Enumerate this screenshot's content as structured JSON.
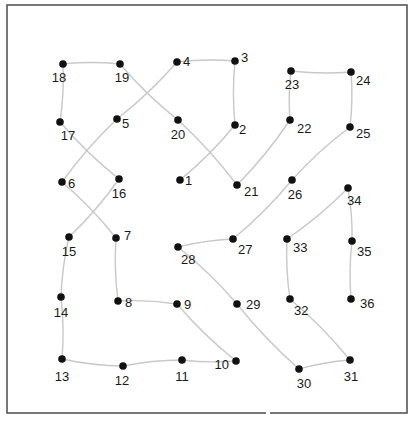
{
  "puzzle": {
    "type": "connect-the-dots",
    "frame": {
      "x": 7,
      "y": 5,
      "width": 400,
      "height": 408,
      "stroke": "#555555"
    },
    "line_color": "#c8c8c8",
    "dot_color": "#111111",
    "label_color": "#1a1a1a",
    "dots": [
      {
        "n": "1",
        "x": 180,
        "y": 180,
        "lx": 185,
        "ly": 185,
        "anchor": "start"
      },
      {
        "n": "2",
        "x": 235,
        "y": 125,
        "lx": 239,
        "ly": 134,
        "anchor": "start"
      },
      {
        "n": "3",
        "x": 235,
        "y": 61,
        "lx": 241,
        "ly": 62,
        "anchor": "start"
      },
      {
        "n": "4",
        "x": 177,
        "y": 62,
        "lx": 183,
        "ly": 66,
        "anchor": "start"
      },
      {
        "n": "5",
        "x": 117,
        "y": 119,
        "lx": 122,
        "ly": 128,
        "anchor": "start"
      },
      {
        "n": "6",
        "x": 62,
        "y": 182,
        "lx": 68,
        "ly": 188,
        "anchor": "start"
      },
      {
        "n": "7",
        "x": 116,
        "y": 238,
        "lx": 124,
        "ly": 240,
        "anchor": "start"
      },
      {
        "n": "8",
        "x": 118,
        "y": 301,
        "lx": 125,
        "ly": 307,
        "anchor": "start"
      },
      {
        "n": "9",
        "x": 177,
        "y": 304,
        "lx": 184,
        "ly": 309,
        "anchor": "start"
      },
      {
        "n": "10",
        "x": 236,
        "y": 361,
        "lx": 229,
        "ly": 369,
        "anchor": "end"
      },
      {
        "n": "11",
        "x": 182,
        "y": 360,
        "lx": 182,
        "ly": 381,
        "anchor": "middle"
      },
      {
        "n": "12",
        "x": 123,
        "y": 366,
        "lx": 122,
        "ly": 385,
        "anchor": "middle"
      },
      {
        "n": "13",
        "x": 62,
        "y": 359,
        "lx": 62,
        "ly": 381,
        "anchor": "middle"
      },
      {
        "n": "14",
        "x": 61,
        "y": 297,
        "lx": 61,
        "ly": 317,
        "anchor": "middle"
      },
      {
        "n": "15",
        "x": 69,
        "y": 237,
        "lx": 69,
        "ly": 256,
        "anchor": "middle"
      },
      {
        "n": "16",
        "x": 119,
        "y": 179,
        "lx": 119,
        "ly": 198,
        "anchor": "middle"
      },
      {
        "n": "17",
        "x": 60,
        "y": 122,
        "lx": 68,
        "ly": 140,
        "anchor": "middle"
      },
      {
        "n": "18",
        "x": 63,
        "y": 64,
        "lx": 59,
        "ly": 82,
        "anchor": "middle"
      },
      {
        "n": "19",
        "x": 120,
        "y": 64,
        "lx": 122,
        "ly": 82,
        "anchor": "middle"
      },
      {
        "n": "20",
        "x": 178,
        "y": 120,
        "lx": 178,
        "ly": 139,
        "anchor": "middle"
      },
      {
        "n": "21",
        "x": 237,
        "y": 185,
        "lx": 244,
        "ly": 196,
        "anchor": "start"
      },
      {
        "n": "22",
        "x": 290,
        "y": 120,
        "lx": 297,
        "ly": 133,
        "anchor": "start"
      },
      {
        "n": "23",
        "x": 291,
        "y": 71,
        "lx": 292,
        "ly": 89,
        "anchor": "middle"
      },
      {
        "n": "24",
        "x": 351,
        "y": 72,
        "lx": 356,
        "ly": 85,
        "anchor": "start"
      },
      {
        "n": "25",
        "x": 350,
        "y": 127,
        "lx": 356,
        "ly": 138,
        "anchor": "start"
      },
      {
        "n": "26",
        "x": 292,
        "y": 180,
        "lx": 295,
        "ly": 199,
        "anchor": "middle"
      },
      {
        "n": "27",
        "x": 233,
        "y": 239,
        "lx": 238,
        "ly": 254,
        "anchor": "start"
      },
      {
        "n": "28",
        "x": 178,
        "y": 247,
        "lx": 181,
        "ly": 264,
        "anchor": "start"
      },
      {
        "n": "29",
        "x": 237,
        "y": 304,
        "lx": 246,
        "ly": 309,
        "anchor": "start"
      },
      {
        "n": "30",
        "x": 299,
        "y": 369,
        "lx": 304,
        "ly": 388,
        "anchor": "middle"
      },
      {
        "n": "31",
        "x": 350,
        "y": 360,
        "lx": 351,
        "ly": 381,
        "anchor": "middle"
      },
      {
        "n": "32",
        "x": 290,
        "y": 299,
        "lx": 294,
        "ly": 315,
        "anchor": "start"
      },
      {
        "n": "33",
        "x": 287,
        "y": 239,
        "lx": 293,
        "ly": 252,
        "anchor": "start"
      },
      {
        "n": "34",
        "x": 348,
        "y": 188,
        "lx": 347,
        "ly": 205,
        "anchor": "start"
      },
      {
        "n": "35",
        "x": 352,
        "y": 241,
        "lx": 357,
        "ly": 256,
        "anchor": "start"
      },
      {
        "n": "36",
        "x": 351,
        "y": 299,
        "lx": 360,
        "ly": 308,
        "anchor": "start"
      }
    ]
  }
}
